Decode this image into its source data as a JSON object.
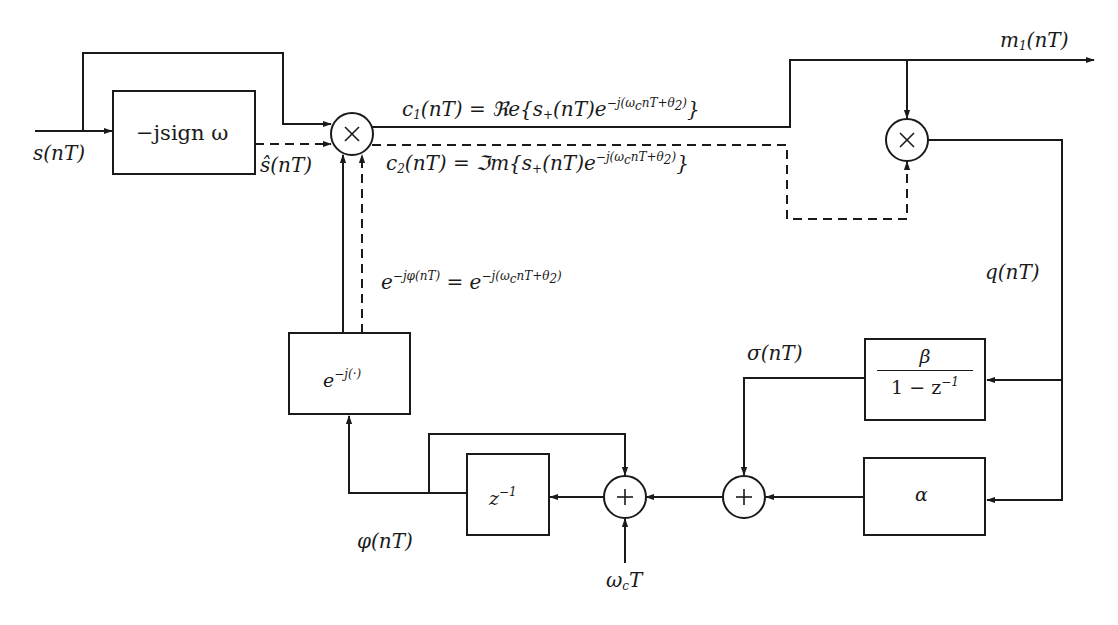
{
  "diagram": {
    "type": "block-diagram",
    "blocks": {
      "hilbert": {
        "label": "−jsign ω"
      },
      "exp": {
        "label": "e",
        "sup": "−j(·)"
      },
      "loop_filter_integral": {
        "numerator": "β",
        "denominator": "1 − z",
        "den_sup": "−1"
      },
      "loop_filter_proportional": {
        "label": "α"
      },
      "delay": {
        "label": "z",
        "sup": "−1"
      },
      "multiplier_1": {
        "symbol": "×"
      },
      "multiplier_2": {
        "symbol": "×"
      },
      "adder_1": {
        "symbol": "+"
      },
      "adder_2": {
        "symbol": "+"
      }
    },
    "signals": {
      "input": "s(nT)",
      "hilbert_output": "ŝ(nT)",
      "c1_lhs": "c",
      "c1_sub": "1",
      "c1_rhs": "(nT) = ℜe{s",
      "c1_plus": "+",
      "c1_tail": "(nT)e",
      "c1_exp": "−j(ω",
      "c1_exp_c": "c",
      "c1_exp_tail": "nT+θ",
      "c1_exp_2": "2",
      "c1_close": ")",
      "c1_brace": "}",
      "c2_lhs": "c",
      "c2_sub": "2",
      "c2_rhs": "(nT) = ℑm{s",
      "c2_plus": "+",
      "c2_tail": "(nT)e",
      "c2_exp": "−j(ω",
      "c2_exp_c": "c",
      "c2_exp_tail": "nT+θ",
      "c2_exp_2": "2",
      "c2_close": ")",
      "c2_brace": "}",
      "output_m": "m",
      "output_sub": "1",
      "output_tail": "(nT)",
      "error": "q(nT)",
      "sigma": "σ(nT)",
      "phase": "φ(nT)",
      "wct_omega": "ω",
      "wct_c": "c",
      "wct_T": "T",
      "nco_lhs": "e",
      "nco_lhs_sup": "−jφ(nT)",
      "nco_eq": " = e",
      "nco_rhs_sup": "−j(ω",
      "nco_rhs_c": "c",
      "nco_rhs_tail": "nT+θ",
      "nco_rhs_2": "2",
      "nco_rhs_close": ")"
    },
    "line_styles": {
      "solid": "in-phase path",
      "dashed": "quadrature path"
    },
    "colors": {
      "stroke": "#1a1a1a",
      "background": "#ffffff"
    }
  }
}
